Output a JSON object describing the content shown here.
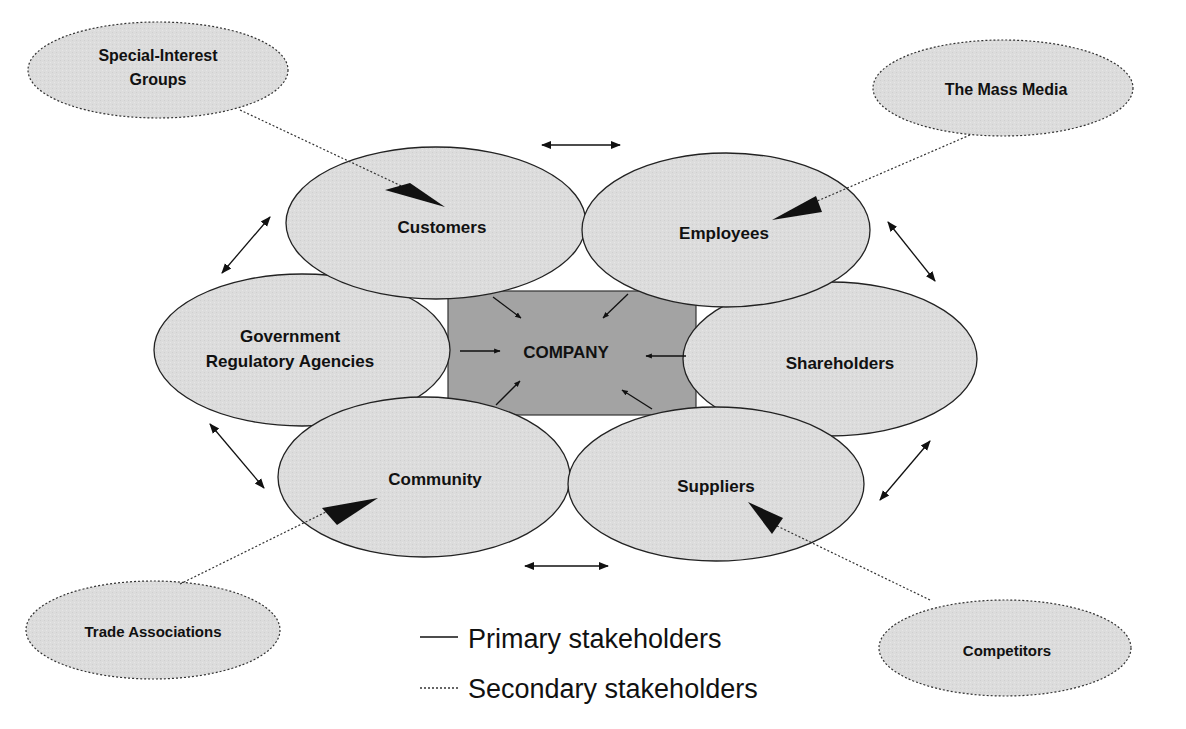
{
  "diagram": {
    "center": {
      "label": "COMPANY",
      "fill": "#a3a3a3"
    },
    "primary_fill": "#dcdcdc",
    "secondary_fill": "#e0e0e0",
    "stroke": "#222222",
    "primary_stakeholders": [
      {
        "id": "customers",
        "label": "Customers"
      },
      {
        "id": "employees",
        "label": "Employees"
      },
      {
        "id": "government",
        "label_line1": "Government",
        "label_line2": "Regulatory Agencies"
      },
      {
        "id": "shareholders",
        "label": "Shareholders"
      },
      {
        "id": "community",
        "label": "Community"
      },
      {
        "id": "suppliers",
        "label": "Suppliers"
      }
    ],
    "secondary_stakeholders": [
      {
        "id": "special-interest",
        "label_line1": "Special-Interest",
        "label_line2": "Groups",
        "points_to": "Customers"
      },
      {
        "id": "mass-media",
        "label": "The Mass Media",
        "points_to": "Employees"
      },
      {
        "id": "trade-associations",
        "label": "Trade Associations",
        "points_to": "Community"
      },
      {
        "id": "competitors",
        "label": "Competitors",
        "points_to": "Suppliers"
      }
    ]
  },
  "legend": {
    "primary": "Primary stakeholders",
    "secondary": "Secondary stakeholders"
  }
}
